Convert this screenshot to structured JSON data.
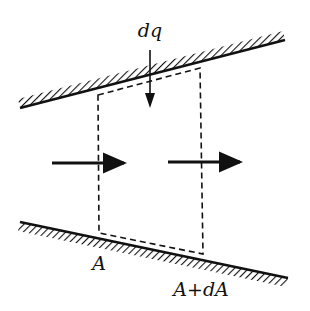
{
  "diagram": {
    "labels": {
      "inflow": "dq",
      "inlet_area": "A",
      "outlet_area": "A+dA"
    },
    "colors": {
      "ink": "#111111",
      "background": "#ffffff"
    },
    "elements": {
      "top_wall": {
        "x1": 20,
        "y1": 108,
        "x2": 285,
        "y2": 40
      },
      "bottom_wall": {
        "x1": 20,
        "y1": 222,
        "x2": 288,
        "y2": 278
      },
      "control_volume": {
        "top_left": [
          98,
          95
        ],
        "top_right": [
          200,
          68
        ],
        "bottom_right": [
          203,
          254
        ],
        "bottom_left": [
          99,
          233
        ]
      },
      "flow_arrows": [
        {
          "x1": 52,
          "y1": 163,
          "x2": 132,
          "y2": 163
        },
        {
          "x1": 168,
          "y1": 162,
          "x2": 248,
          "y2": 162
        }
      ],
      "inflow_arrow": {
        "x1": 150,
        "y1": 50,
        "x2": 150,
        "y2": 108
      }
    }
  }
}
